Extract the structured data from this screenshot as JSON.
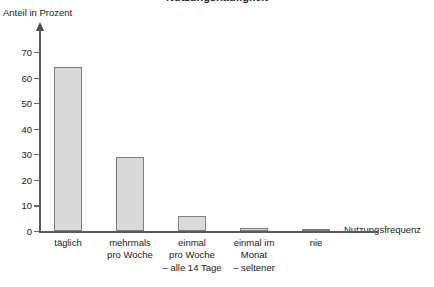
{
  "chart_data": {
    "type": "bar",
    "title": "Nutzungshäufigkeit",
    "xlabel": "Nutzungsfrequenz",
    "ylabel": "Anteil in Prozent",
    "ylim": [
      0,
      70
    ],
    "ytick_step": 10,
    "grid": false,
    "legend": null,
    "categories": [
      "täglich",
      "mehrmals pro Woche",
      "einmal pro Woche – alle 14 Tage",
      "einmal im Monat – seltener",
      "nie"
    ],
    "category_lines": [
      [
        "täglich"
      ],
      [
        "mehrmals",
        "pro Woche"
      ],
      [
        "einmal",
        "pro Woche",
        "– alle 14 Tage"
      ],
      [
        "einmal im",
        "Monat",
        "– seltener"
      ],
      [
        "nie"
      ]
    ],
    "values": [
      64,
      29,
      6,
      1,
      0.3
    ],
    "yticks": [
      0,
      10,
      20,
      30,
      40,
      50,
      60,
      70
    ],
    "bar_fill": "#d9d9d9",
    "bar_border": "#7d7d7d",
    "axis_color": "#5a5a5a"
  }
}
